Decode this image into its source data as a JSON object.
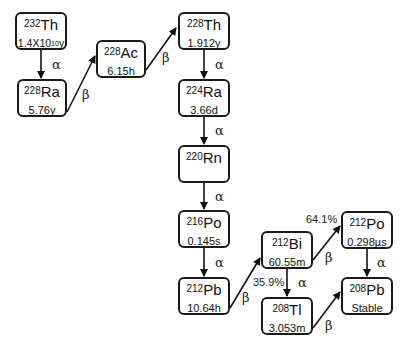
{
  "nodes": [
    {
      "id": "th232",
      "mass": "232",
      "element": "Th",
      "halflife_base": "1.4X10",
      "halflife_exp": "10",
      "halflife_unit": "y"
    },
    {
      "id": "ra228",
      "mass": "228",
      "element": "Ra",
      "halflife": "5.76y"
    },
    {
      "id": "ac228",
      "mass": "228",
      "element": "Ac",
      "halflife": "6.15h"
    },
    {
      "id": "th228",
      "mass": "228",
      "element": "Th",
      "halflife": "1.912y"
    },
    {
      "id": "ra224",
      "mass": "224",
      "element": "Ra",
      "halflife": "3.66d"
    },
    {
      "id": "rn220",
      "mass": "220",
      "element": "Rn",
      "halflife": ""
    },
    {
      "id": "po216",
      "mass": "216",
      "element": "Po",
      "halflife": "0.145s"
    },
    {
      "id": "pb212",
      "mass": "212",
      "element": "Pb",
      "halflife": "10.64h"
    },
    {
      "id": "bi212",
      "mass": "212",
      "element": "Bi",
      "halflife": "60.55m"
    },
    {
      "id": "po212",
      "mass": "212",
      "element": "Po",
      "halflife": "0.298µs"
    },
    {
      "id": "tl208",
      "mass": "208",
      "element": "Tl",
      "halflife": "3.053m"
    },
    {
      "id": "pb208",
      "mass": "208",
      "element": "Pb",
      "halflife": "Stable"
    }
  ],
  "edges": [
    {
      "from": "th232",
      "to": "ra228",
      "decay": "α"
    },
    {
      "from": "ra228",
      "to": "ac228",
      "decay": "β"
    },
    {
      "from": "ac228",
      "to": "th228",
      "decay": "β"
    },
    {
      "from": "th228",
      "to": "ra224",
      "decay": "α"
    },
    {
      "from": "ra224",
      "to": "rn220",
      "decay": "α"
    },
    {
      "from": "rn220",
      "to": "po216",
      "decay": "α"
    },
    {
      "from": "po216",
      "to": "pb212",
      "decay": "α"
    },
    {
      "from": "pb212",
      "to": "bi212",
      "decay": "β"
    },
    {
      "from": "bi212",
      "to": "po212",
      "decay": "β",
      "branch": "64.1%"
    },
    {
      "from": "bi212",
      "to": "tl208",
      "decay": "α",
      "branch": "35.9%"
    },
    {
      "from": "po212",
      "to": "pb208",
      "decay": "α"
    },
    {
      "from": "tl208",
      "to": "pb208",
      "decay": "β"
    }
  ]
}
